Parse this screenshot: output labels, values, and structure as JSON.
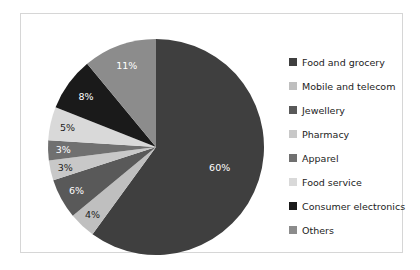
{
  "chart_data": {
    "type": "pie",
    "title": "",
    "subtitle": "",
    "xlabel": "",
    "ylabel": "",
    "grid": false,
    "legend_position": "right",
    "start_angle_deg": 0,
    "direction": "clockwise",
    "categories": [
      "Food and grocery",
      "Mobile and telecom",
      "Jewellery",
      "Pharmacy",
      "Apparel",
      "Food service",
      "Consumer electronics",
      "Others"
    ],
    "values": [
      60,
      4,
      6,
      3,
      3,
      5,
      8,
      11
    ],
    "value_labels": [
      "60%",
      "4%",
      "6%",
      "3%",
      "3%",
      "5%",
      "8%",
      "11%"
    ],
    "colors": [
      "#3f3f3f",
      "#bfbfbf",
      "#595959",
      "#c8c8c8",
      "#707070",
      "#d9d9d9",
      "#1a1a1a",
      "#8c8c8c"
    ],
    "label_text_colors": [
      "#ffffff",
      "#1c1c1c",
      "#ffffff",
      "#1c1c1c",
      "#ffffff",
      "#1c1c1c",
      "#ffffff",
      "#ffffff"
    ],
    "slices": [
      {
        "label": "Food and grocery",
        "value": 60,
        "display": "60%",
        "color": "#3f3f3f",
        "text_color": "#ffffff"
      },
      {
        "label": "Mobile and telecom",
        "value": 4,
        "display": "4%",
        "color": "#bfbfbf",
        "text_color": "#1c1c1c"
      },
      {
        "label": "Jewellery",
        "value": 6,
        "display": "6%",
        "color": "#595959",
        "text_color": "#ffffff"
      },
      {
        "label": "Pharmacy",
        "value": 3,
        "display": "3%",
        "color": "#c8c8c8",
        "text_color": "#1c1c1c"
      },
      {
        "label": "Apparel",
        "value": 3,
        "display": "3%",
        "color": "#707070",
        "text_color": "#ffffff"
      },
      {
        "label": "Food service",
        "value": 5,
        "display": "5%",
        "color": "#d9d9d9",
        "text_color": "#1c1c1c"
      },
      {
        "label": "Consumer electronics",
        "value": 8,
        "display": "8%",
        "color": "#1a1a1a",
        "text_color": "#ffffff"
      },
      {
        "label": "Others",
        "value": 11,
        "display": "11%",
        "color": "#8c8c8c",
        "text_color": "#ffffff"
      }
    ]
  },
  "legend": {
    "items": [
      {
        "label": "Food and grocery",
        "color": "#3f3f3f"
      },
      {
        "label": "Mobile and telecom",
        "color": "#bfbfbf"
      },
      {
        "label": "Jewellery",
        "color": "#595959"
      },
      {
        "label": "Pharmacy",
        "color": "#c8c8c8"
      },
      {
        "label": "Apparel",
        "color": "#707070"
      },
      {
        "label": "Food service",
        "color": "#d9d9d9"
      },
      {
        "label": "Consumer electronics",
        "color": "#1a1a1a"
      },
      {
        "label": "Others",
        "color": "#8c8c8c"
      }
    ]
  },
  "frame": {
    "border_color": "#d6d6d6",
    "background": "#ffffff"
  }
}
